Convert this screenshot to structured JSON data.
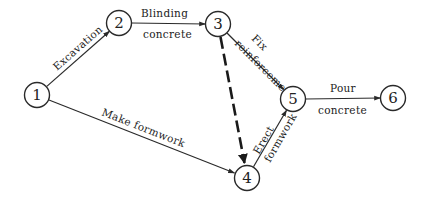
{
  "diagram": {
    "type": "activity-on-arrow network",
    "nodes": [
      {
        "id": "1",
        "label": "1",
        "x": 37,
        "y": 95
      },
      {
        "id": "2",
        "label": "2",
        "x": 119,
        "y": 23
      },
      {
        "id": "3",
        "label": "3",
        "x": 218,
        "y": 24
      },
      {
        "id": "4",
        "label": "4",
        "x": 247,
        "y": 178
      },
      {
        "id": "5",
        "label": "5",
        "x": 293,
        "y": 99
      },
      {
        "id": "6",
        "label": "6",
        "x": 393,
        "y": 98
      }
    ],
    "edges": [
      {
        "from": "1",
        "to": "2",
        "label_lines": [
          "Excavation"
        ],
        "style": "solid"
      },
      {
        "from": "2",
        "to": "3",
        "label_lines": [
          "Blinding",
          "concrete"
        ],
        "style": "solid"
      },
      {
        "from": "3",
        "to": "5",
        "label_lines": [
          "Fix",
          "reinforcement"
        ],
        "style": "solid"
      },
      {
        "from": "3",
        "to": "4",
        "label_lines": [],
        "style": "dashed",
        "note": "dummy activity"
      },
      {
        "from": "1",
        "to": "4",
        "label_lines": [
          "Make formwork"
        ],
        "style": "solid"
      },
      {
        "from": "4",
        "to": "5",
        "label_lines": [
          "Erect",
          "formwork"
        ],
        "style": "solid"
      },
      {
        "from": "5",
        "to": "6",
        "label_lines": [
          "Pour",
          "concrete"
        ],
        "style": "solid"
      }
    ],
    "colors": {
      "line": "#2a2a2a",
      "text": "#222222",
      "background": "#ffffff"
    }
  }
}
